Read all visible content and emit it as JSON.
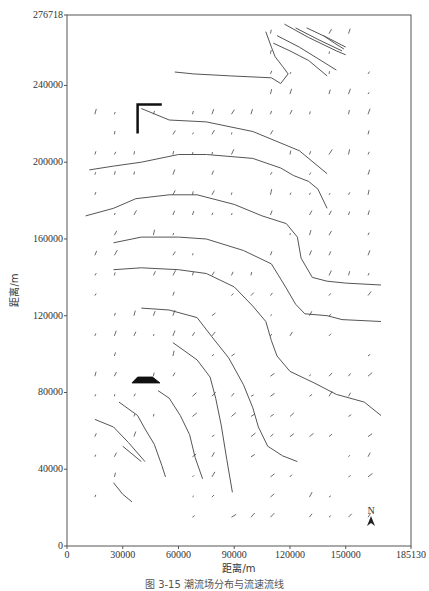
{
  "chart_data": {
    "type": "contour",
    "title": "",
    "xlabel": "距离/m",
    "ylabel": "距离/m",
    "xlim": [
      0,
      185130
    ],
    "ylim": [
      0,
      276718
    ],
    "x_ticks": [
      0,
      30000,
      60000,
      90000,
      120000,
      150000,
      185130
    ],
    "x_tick_labels": [
      "0",
      "30000",
      "60000",
      "90000",
      "120000",
      "150000",
      "185130"
    ],
    "y_ticks": [
      0,
      40000,
      80000,
      120000,
      160000,
      200000,
      240000,
      276718
    ],
    "y_tick_labels": [
      "0",
      "40000",
      "80000",
      "120000",
      "160000",
      "200000",
      "240000",
      "276718"
    ],
    "grid": false,
    "legend": null,
    "annotations": [
      "N (north arrow)"
    ],
    "contours": [
      {
        "name": "c1",
        "points": [
          [
            58000,
            247000
          ],
          [
            68000,
            246000
          ],
          [
            88000,
            245000
          ],
          [
            110000,
            244000
          ],
          [
            115000,
            241000
          ],
          [
            119000,
            246000
          ],
          [
            116000,
            250000
          ],
          [
            112000,
            255000
          ],
          [
            110000,
            260000
          ],
          [
            107000,
            268000
          ]
        ]
      },
      {
        "name": "c2",
        "points": [
          [
            40000,
            228000
          ],
          [
            55000,
            222000
          ],
          [
            75000,
            221000
          ],
          [
            100000,
            216000
          ],
          [
            125000,
            206000
          ],
          [
            140000,
            194000
          ]
        ]
      },
      {
        "name": "c3",
        "points": [
          [
            12000,
            196000
          ],
          [
            25000,
            198000
          ],
          [
            40000,
            200000
          ],
          [
            60000,
            204000
          ],
          [
            75000,
            204000
          ],
          [
            100000,
            202000
          ],
          [
            115000,
            197000
          ],
          [
            122000,
            193000
          ],
          [
            130000,
            190000
          ],
          [
            135000,
            186000
          ],
          [
            140000,
            176000
          ]
        ]
      },
      {
        "name": "c4",
        "points": [
          [
            10000,
            172000
          ],
          [
            25000,
            176000
          ],
          [
            37000,
            181000
          ],
          [
            55000,
            183000
          ],
          [
            70000,
            183000
          ],
          [
            90000,
            178000
          ],
          [
            105000,
            172000
          ],
          [
            118000,
            168000
          ],
          [
            124000,
            161000
          ],
          [
            126000,
            150000
          ],
          [
            132000,
            140000
          ],
          [
            140000,
            138000
          ],
          [
            150000,
            137000
          ],
          [
            169000,
            136000
          ]
        ]
      },
      {
        "name": "c5",
        "points": [
          [
            25000,
            158000
          ],
          [
            40000,
            161000
          ],
          [
            60000,
            161000
          ],
          [
            75000,
            160000
          ],
          [
            95000,
            154000
          ],
          [
            110000,
            147000
          ],
          [
            117000,
            136000
          ],
          [
            123000,
            126000
          ],
          [
            128000,
            121000
          ],
          [
            140000,
            120000
          ],
          [
            148000,
            118000
          ],
          [
            169000,
            117000
          ]
        ]
      },
      {
        "name": "c6",
        "points": [
          [
            25000,
            144000
          ],
          [
            40000,
            145000
          ],
          [
            60000,
            144000
          ],
          [
            75000,
            142000
          ],
          [
            90000,
            135000
          ],
          [
            100000,
            125000
          ],
          [
            107000,
            117000
          ],
          [
            110000,
            107000
          ],
          [
            113000,
            99000
          ],
          [
            120000,
            91000
          ],
          [
            133000,
            85000
          ],
          [
            145000,
            79000
          ],
          [
            160000,
            75000
          ],
          [
            169000,
            68000
          ]
        ]
      },
      {
        "name": "c7",
        "points": [
          [
            40000,
            124000
          ],
          [
            55000,
            123000
          ],
          [
            70000,
            119000
          ],
          [
            78000,
            109000
          ],
          [
            87000,
            98000
          ],
          [
            95000,
            84000
          ],
          [
            100000,
            72000
          ],
          [
            103000,
            62000
          ],
          [
            108000,
            52000
          ],
          [
            116000,
            47000
          ],
          [
            124000,
            44000
          ]
        ]
      },
      {
        "name": "c8",
        "points": [
          [
            57000,
            106000
          ],
          [
            70000,
            97000
          ],
          [
            77000,
            88000
          ],
          [
            80000,
            77000
          ],
          [
            83000,
            63000
          ],
          [
            86000,
            45000
          ],
          [
            89000,
            28000
          ]
        ]
      },
      {
        "name": "c9",
        "points": [
          [
            49000,
            81000
          ],
          [
            55000,
            77000
          ],
          [
            61000,
            68000
          ],
          [
            66000,
            58000
          ],
          [
            69000,
            46000
          ],
          [
            73000,
            35000
          ]
        ]
      },
      {
        "name": "c10",
        "points": [
          [
            28000,
            75000
          ],
          [
            38000,
            68000
          ],
          [
            42000,
            61000
          ],
          [
            47000,
            53000
          ],
          [
            51000,
            42000
          ],
          [
            53000,
            36000
          ]
        ]
      },
      {
        "name": "c11",
        "points": [
          [
            15000,
            66000
          ],
          [
            25000,
            62000
          ],
          [
            33000,
            54000
          ],
          [
            42000,
            44000
          ]
        ]
      },
      {
        "name": "c12",
        "points": [
          [
            30000,
            52000
          ],
          [
            40000,
            44000
          ]
        ]
      },
      {
        "name": "c13",
        "points": [
          [
            25000,
            33000
          ],
          [
            30000,
            27000
          ],
          [
            35000,
            23000
          ]
        ]
      },
      {
        "name": "c14",
        "points": [
          [
            111000,
            262000
          ],
          [
            120000,
            258000
          ],
          [
            130000,
            253000
          ],
          [
            140000,
            245000
          ]
        ]
      },
      {
        "name": "c15",
        "points": [
          [
            113000,
            266000
          ],
          [
            125000,
            260000
          ],
          [
            135000,
            254000
          ],
          [
            145000,
            248000
          ]
        ]
      },
      {
        "name": "c16",
        "points": [
          [
            117000,
            272000
          ],
          [
            130000,
            265000
          ],
          [
            145000,
            258000
          ],
          [
            150000,
            256000
          ]
        ]
      },
      {
        "name": "c17",
        "points": [
          [
            123000,
            270000
          ],
          [
            135000,
            264000
          ],
          [
            148000,
            258000
          ]
        ]
      },
      {
        "name": "c18",
        "points": [
          [
            129000,
            270000
          ],
          [
            140000,
            265000
          ],
          [
            150000,
            260000
          ]
        ]
      },
      {
        "name": "c19",
        "points": [
          [
            138000,
            266000
          ],
          [
            144000,
            262000
          ],
          [
            149000,
            259000
          ]
        ]
      }
    ],
    "land_markers": [
      {
        "name": "coast-block-upper",
        "points": [
          [
            38000,
            215000
          ],
          [
            38000,
            230000
          ],
          [
            51000,
            230000
          ]
        ]
      },
      {
        "name": "coast-block-lower",
        "points": [
          [
            38000,
            88000
          ],
          [
            46000,
            88000
          ],
          [
            50000,
            85000
          ],
          [
            35000,
            85000
          ]
        ]
      }
    ],
    "vectors_description": "Short current-velocity arrows distributed on a regular grid (spacing ~10000 m) across the water domain"
  },
  "axes": {
    "x_title": "距离/m",
    "y_title": "距离/m",
    "x_tick_labels": [
      "0",
      "30000",
      "60000",
      "90000",
      "120000",
      "150000",
      "185130"
    ],
    "y_tick_labels": [
      "0",
      "40000",
      "80000",
      "120000",
      "160000",
      "200000",
      "240000",
      "276718"
    ]
  },
  "north_arrow": {
    "label": "N"
  },
  "caption": "图 3-15  潮流场分布与流速流线"
}
